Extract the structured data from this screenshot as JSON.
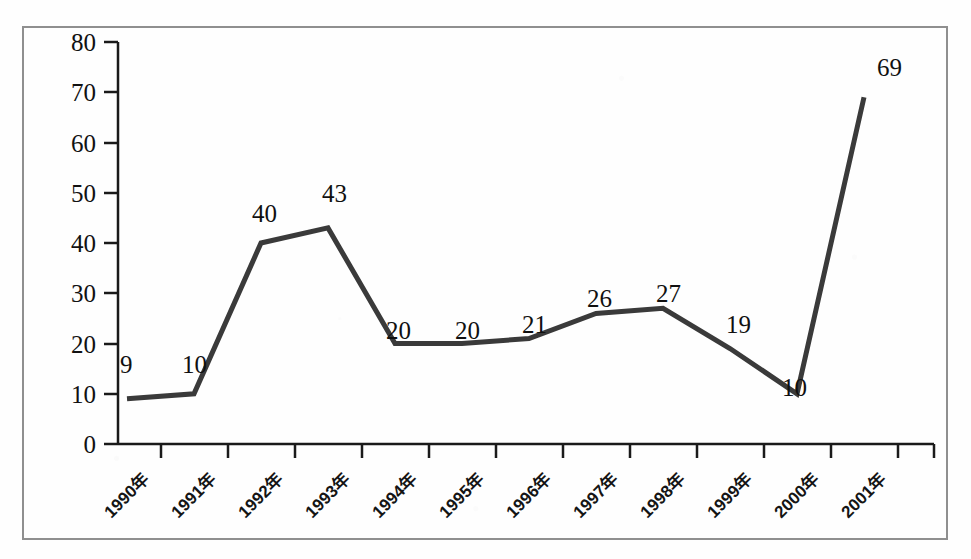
{
  "chart_data": {
    "type": "line",
    "title": "",
    "subtitle": "",
    "xlabel": "",
    "ylabel": "",
    "categories": [
      "1990年",
      "1991年",
      "1992年",
      "1993年",
      "1994年",
      "1995年",
      "1996年",
      "1997年",
      "1998年",
      "1999年",
      "2000年",
      "2001年"
    ],
    "values": [
      9,
      10,
      40,
      43,
      20,
      20,
      21,
      26,
      27,
      19,
      10,
      69
    ],
    "series": [
      {
        "name": "",
        "values": [
          9,
          10,
          40,
          43,
          20,
          20,
          21,
          26,
          27,
          19,
          10,
          69
        ]
      }
    ],
    "ylim": [
      0,
      80
    ],
    "y_ticks": [
      0,
      10,
      20,
      30,
      40,
      50,
      60,
      70,
      80
    ],
    "y_tick_labels": [
      "0",
      "10",
      "20",
      "30",
      "40",
      "50",
      "60",
      "70",
      "80"
    ],
    "data_labels": [
      "9",
      "10",
      "40",
      "43",
      "20",
      "20",
      "21",
      "26",
      "27",
      "19",
      "10",
      "69"
    ],
    "grid": false,
    "legend": "none",
    "markers": false,
    "line_color": "#3a3a3a",
    "line_width": 5,
    "axis_color": "#1a1a1a",
    "frame_color": "#8f8f8f",
    "background_color": "#fefefe",
    "x_tick_rotation": -45
  }
}
